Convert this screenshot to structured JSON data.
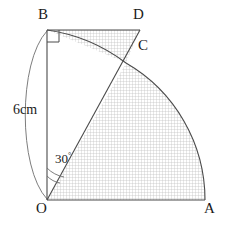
{
  "figure": {
    "points": {
      "O": {
        "label": "O",
        "x": 47,
        "y": 200
      },
      "A": {
        "label": "A",
        "x": 205,
        "y": 200
      },
      "B": {
        "label": "B",
        "x": 47,
        "y": 30
      },
      "C": {
        "label": "C",
        "x": 126,
        "y": 63
      },
      "D": {
        "label": "D",
        "x": 140,
        "y": 30
      }
    },
    "measurements": {
      "radius_label": "6cm",
      "angle_value": "30",
      "angle_unit": "°"
    },
    "style": {
      "stroke": "#4a4a4a",
      "label_color": "#1a1a1a",
      "hatch_color": "#b9b9b9",
      "hatch_bg": "#ffffff"
    },
    "elements": {
      "segment_OA": "O-A base line",
      "segment_OB": "O-B vertical radius",
      "segment_BD": "B-D horizontal line",
      "segment_OC_D": "O through C to D",
      "arc_AC": "arc from A to C centered at O",
      "arc_BC": "arc from B to C",
      "right_angle_at_B": "right angle marker at B",
      "angle_arcs_at_O": "double arc marking 30 degrees at O",
      "dimension_arc": "curved dimension brace for 6cm",
      "shaded_region": "hatched region bounded by BD, arc BC, OC, OA and arc CA"
    }
  }
}
